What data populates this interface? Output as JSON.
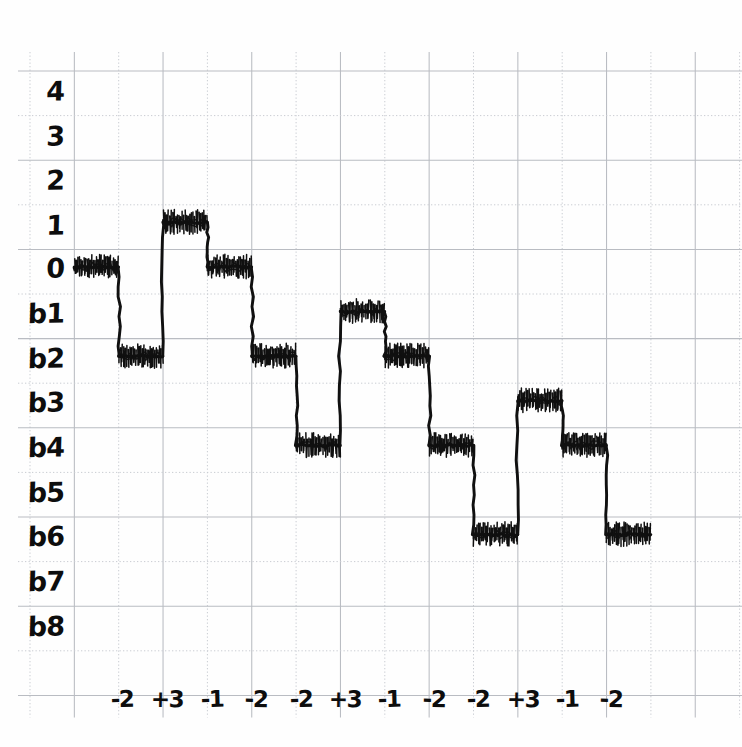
{
  "chart_data": {
    "type": "line",
    "title": "",
    "subtitle": "",
    "xlabel": "",
    "ylabel": "",
    "grid": true,
    "legend": null,
    "style": "hand-drawn staircase waveform on graph paper",
    "y_tick_labels": [
      "4",
      "3",
      "2",
      "1",
      "0",
      "b1",
      "b2",
      "b3",
      "b4",
      "b5",
      "b6",
      "b7",
      "b8"
    ],
    "y_tick_values": [
      4,
      3,
      2,
      1,
      0,
      -1,
      -2,
      -3,
      -4,
      -5,
      -6,
      -7,
      -8
    ],
    "ylim": [
      -8.5,
      4.5
    ],
    "x_tick_labels": [
      "-2",
      "+3",
      "-1",
      "-2",
      "-2",
      "+3",
      "-1",
      "-2",
      "-2",
      "+3",
      "-1",
      "-2"
    ],
    "x_tick_values": [
      -2,
      3,
      -1,
      -2,
      -2,
      3,
      -1,
      -2,
      -2,
      3,
      -1,
      -2
    ],
    "x_tick_meaning": "step increment applied at each transition",
    "steps": [
      {
        "index": 0,
        "label": "",
        "level_label": "0",
        "level": 0
      },
      {
        "index": 1,
        "label": "-2",
        "level_label": "b2",
        "level": -2
      },
      {
        "index": 2,
        "label": "+3",
        "level_label": "1",
        "level": 1
      },
      {
        "index": 3,
        "label": "-1",
        "level_label": "0",
        "level": 0
      },
      {
        "index": 4,
        "label": "-2",
        "level_label": "b2",
        "level": -2
      },
      {
        "index": 5,
        "label": "-2",
        "level_label": "b4",
        "level": -4
      },
      {
        "index": 6,
        "label": "+3",
        "level_label": "b1",
        "level": -1
      },
      {
        "index": 7,
        "label": "-1",
        "level_label": "b2",
        "level": -2
      },
      {
        "index": 8,
        "label": "-2",
        "level_label": "b4",
        "level": -4
      },
      {
        "index": 9,
        "label": "-2",
        "level_label": "b6",
        "level": -6
      },
      {
        "index": 10,
        "label": "+3",
        "level_label": "b3",
        "level": -3
      },
      {
        "index": 11,
        "label": "-1",
        "level_label": "b4",
        "level": -4
      },
      {
        "index": 12,
        "label": "-2",
        "level_label": "b6",
        "level": -6
      }
    ],
    "series": [
      {
        "name": "staircase",
        "values": [
          0,
          -2,
          1,
          0,
          -2,
          -4,
          -1,
          -2,
          -4,
          -6,
          -3,
          -4,
          -6
        ]
      }
    ],
    "colors": {
      "trace": "#101010",
      "grid_solid": "#b9bcc2",
      "grid_dotted": "#c9ccd2",
      "background": "#fefefe",
      "ink": "#0d0d0d"
    }
  },
  "y_labels": [
    {
      "text": "4",
      "top": 76
    },
    {
      "text": "3",
      "top": 121
    },
    {
      "text": "2",
      "top": 165
    },
    {
      "text": "1",
      "top": 210
    },
    {
      "text": "0",
      "top": 253
    },
    {
      "text": "b1",
      "top": 298
    },
    {
      "text": "b2",
      "top": 343
    },
    {
      "text": "b3",
      "top": 387
    },
    {
      "text": "b4",
      "top": 432
    },
    {
      "text": "b5",
      "top": 477
    },
    {
      "text": "b6",
      "top": 521
    },
    {
      "text": "b7",
      "top": 566
    },
    {
      "text": "b8",
      "top": 611
    }
  ],
  "x_labels": [
    {
      "text": "-2",
      "left": 94
    },
    {
      "text": "+3",
      "left": 139
    },
    {
      "text": "-1",
      "left": 184
    },
    {
      "text": "-2",
      "left": 228
    },
    {
      "text": "-2",
      "left": 273
    },
    {
      "text": "+3",
      "left": 317
    },
    {
      "text": "-1",
      "left": 361
    },
    {
      "text": "-2",
      "left": 406
    },
    {
      "text": "-2",
      "left": 450
    },
    {
      "text": "+3",
      "left": 495
    },
    {
      "text": "-1",
      "left": 539
    },
    {
      "text": "-2",
      "left": 583
    }
  ]
}
